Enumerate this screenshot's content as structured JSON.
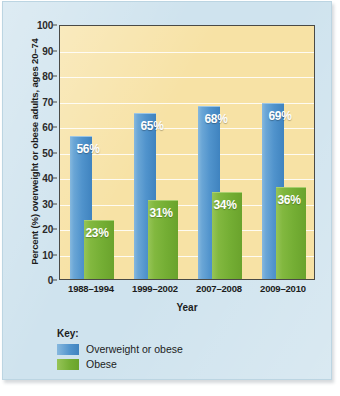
{
  "chart_data": {
    "type": "bar",
    "title": "",
    "xlabel": "Year",
    "ylabel": "Percent (%) overweight or obese adults, ages 20–74",
    "categories": [
      "1988–1994",
      "1999–2002",
      "2007–2008",
      "2009–2010"
    ],
    "series": [
      {
        "name": "Overweight or obese",
        "color": "#5093cc",
        "values": [
          56,
          65,
          68,
          69
        ],
        "labels": [
          "56%",
          "65%",
          "68%",
          "69%"
        ]
      },
      {
        "name": "Obese",
        "color": "#74ae34",
        "values": [
          23,
          31,
          34,
          36
        ],
        "labels": [
          "23%",
          "31%",
          "34%",
          "36%"
        ]
      }
    ],
    "ylim": [
      0,
      100
    ],
    "ytick_step": 10,
    "yticks": [
      "100",
      "90",
      "80",
      "70",
      "60",
      "50",
      "40",
      "30",
      "20",
      "10",
      "0"
    ],
    "grid": true,
    "legend_position": "below-plot",
    "plot_background": "#f7e2a5",
    "card_background": "#cfe3ee"
  },
  "legend": {
    "title": "Key:",
    "entries": [
      {
        "label": "Overweight or obese",
        "swatch": "blue-swatch-icon"
      },
      {
        "label": "Obese",
        "swatch": "green-swatch-icon"
      }
    ]
  }
}
